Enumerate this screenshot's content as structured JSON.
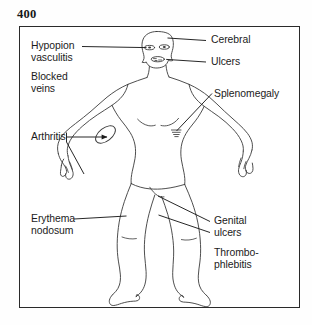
{
  "page": {
    "folio": "400",
    "figure_caption": ""
  },
  "colors": {
    "ink": "#1b1b1b",
    "frame": "#2a2a2a",
    "body_outline": "#3a3a3a",
    "paper": "#ffffff"
  },
  "diagram": {
    "type": "labeled-anatomical-figure",
    "labels": [
      {
        "id": "hypopion-vasculitis",
        "text": "Hypopion\nvasculitis",
        "side": "left",
        "target": "eye"
      },
      {
        "id": "blocked-veins",
        "text": "Blocked\nveins",
        "side": "left",
        "target": "none"
      },
      {
        "id": "arthritis",
        "text": "Arthritis",
        "side": "left",
        "target": "elbow"
      },
      {
        "id": "erythema-nodosum",
        "text": "Erythema\nnodosum",
        "side": "left",
        "target": "shin"
      },
      {
        "id": "cerebral",
        "text": "Cerebral",
        "side": "right",
        "target": "head"
      },
      {
        "id": "ulcers",
        "text": "Ulcers",
        "side": "right",
        "target": "mouth"
      },
      {
        "id": "splenomegaly",
        "text": "Splenomegaly",
        "side": "right",
        "target": "left-upper-abdomen"
      },
      {
        "id": "genital-ulcers",
        "text": "Genital\nulcers",
        "side": "right",
        "target": "groin"
      },
      {
        "id": "thrombophlebitis",
        "text": "Thrombo-\nphlebitis",
        "side": "right",
        "target": "thigh"
      }
    ]
  }
}
